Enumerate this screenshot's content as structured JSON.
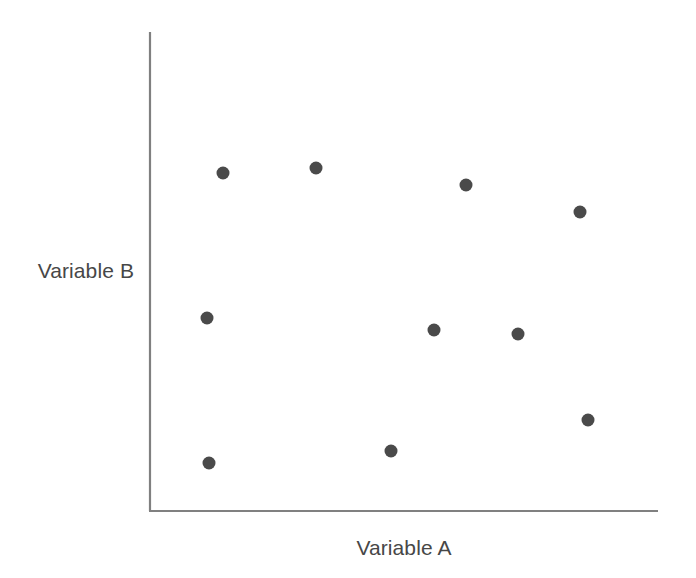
{
  "figure": {
    "background_color": "#ffffff",
    "width": 696,
    "height": 578
  },
  "axes": {
    "line_color": "#808080",
    "y_axis": {
      "x": 149,
      "y_top": 32,
      "y_bottom": 511
    },
    "x_axis": {
      "y": 511,
      "x_left": 149,
      "x_right": 658
    }
  },
  "labels": {
    "x_axis_label": "Variable A",
    "y_axis_label": "Variable B",
    "text_color": "#474747"
  },
  "chart_data": {
    "type": "scatter",
    "title": "",
    "xlabel": "Variable A",
    "ylabel": "Variable B",
    "grid": false,
    "legend": "none",
    "axis_ticks": "none",
    "marker": {
      "shape": "circle",
      "color": "#4a4a4a",
      "radius_px": 6.5
    },
    "xlim": [
      0,
      100
    ],
    "ylim": [
      0,
      100
    ],
    "points_px": [
      {
        "x": 223,
        "y": 173
      },
      {
        "x": 316,
        "y": 168
      },
      {
        "x": 466,
        "y": 185
      },
      {
        "x": 580,
        "y": 212
      },
      {
        "x": 207,
        "y": 318
      },
      {
        "x": 434,
        "y": 330
      },
      {
        "x": 518,
        "y": 334
      },
      {
        "x": 588,
        "y": 420
      },
      {
        "x": 209,
        "y": 463
      },
      {
        "x": 391,
        "y": 451
      }
    ],
    "x": [
      14.5,
      32.8,
      62.3,
      84.7,
      11.4,
      56.0,
      72.5,
      86.2,
      11.8,
      47.5
    ],
    "y": [
      70.6,
      71.6,
      68.1,
      62.4,
      40.3,
      37.8,
      37.0,
      19.0,
      10.0,
      12.5
    ]
  }
}
